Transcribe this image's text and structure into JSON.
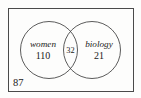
{
  "figure": {
    "type": "venn-diagram",
    "sets": 2,
    "stroke_color": "#4a4a4a",
    "text_color": "#1a1a1a",
    "background_color": "#fdfdfc"
  },
  "universe": {
    "label": "87",
    "description": "outside-both-circles count"
  },
  "left_set": {
    "name": "women",
    "count": "110"
  },
  "right_set": {
    "name": "biology",
    "count": "21"
  },
  "intersection": {
    "count": "32"
  }
}
